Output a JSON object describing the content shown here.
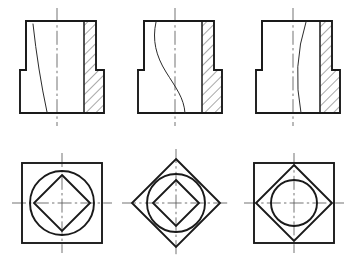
{
  "drawing": {
    "title": "Orthographic section views of intersecting solids",
    "sheet_width": 354,
    "sheet_height": 264,
    "background_color": "#ffffff",
    "line_color": "#1a1a1a",
    "curve_color": "#2b2b2b",
    "centerline_color": "#5a5a5a",
    "hatch_color": "#333333",
    "view_count": 6,
    "rows": 2,
    "columns": 3
  },
  "views": [
    {
      "id": "front-view-1",
      "label": "Front section view 1",
      "position": "top-left",
      "type": "front-section",
      "body_outline": "Stepped block: tall upper rectangle on a wider lower base",
      "upper_rect": {
        "x": 26,
        "y": 21,
        "width": 70,
        "height": 49
      },
      "lower_rect": {
        "x": 20,
        "y": 70,
        "width": 84,
        "height": 43
      },
      "hatch_region": "right vertical band stepped outward at base",
      "hatch_angle_deg": 45,
      "intersection_curve": "near-straight line sloping right-to-left downward",
      "vertical_centerline_x": 57,
      "centerline_top_y": 8,
      "centerline_bottom_y": 126
    },
    {
      "id": "front-view-2",
      "label": "Front section view 2",
      "position": "top-center",
      "type": "front-section",
      "body_outline": "Stepped block: tall upper rectangle on a wider lower base",
      "upper_rect": {
        "x": 144,
        "y": 21,
        "width": 70,
        "height": 49
      },
      "lower_rect": {
        "x": 138,
        "y": 70,
        "width": 84,
        "height": 43
      },
      "hatch_region": "right vertical band stepped outward at base",
      "hatch_angle_deg": 45,
      "intersection_curve": "S-shaped double-curve crossing the centerline",
      "vertical_centerline_x": 175,
      "centerline_top_y": 8,
      "centerline_bottom_y": 126
    },
    {
      "id": "front-view-3",
      "label": "Front section view 3",
      "position": "top-right",
      "type": "front-section",
      "body_outline": "Stepped block: tall upper rectangle on a wider lower base",
      "upper_rect": {
        "x": 262,
        "y": 21,
        "width": 70,
        "height": 49
      },
      "lower_rect": {
        "x": 256,
        "y": 70,
        "width": 84,
        "height": 43
      },
      "hatch_region": "right vertical band stepped outward at base",
      "hatch_angle_deg": 45,
      "intersection_curve": "steep slanted line from upper-right to lower-left",
      "vertical_centerline_x": 293,
      "centerline_top_y": 8,
      "centerline_bottom_y": 126
    },
    {
      "id": "plan-view-1",
      "label": "Plan view 1",
      "position": "bottom-left",
      "type": "plan",
      "outer_shape": "square",
      "middle_shape": "circle",
      "inner_shape": "diamond",
      "center": {
        "x": 62,
        "y": 203
      },
      "square_half_size": 40,
      "circle_radius": 32,
      "diamond_half_diagonal": 28,
      "centerline_extent": 50
    },
    {
      "id": "plan-view-2",
      "label": "Plan view 2",
      "position": "bottom-center",
      "type": "plan",
      "outer_shape": "diamond",
      "middle_shape": "circle",
      "inner_shape": "diamond",
      "center": {
        "x": 176,
        "y": 203
      },
      "outer_diamond_half_diagonal": 44,
      "circle_radius": 29,
      "inner_diamond_half_diagonal": 23,
      "centerline_extent": 54
    },
    {
      "id": "plan-view-3",
      "label": "Plan view 3",
      "position": "bottom-right",
      "type": "plan",
      "outer_shape": "square",
      "middle_shape": "diamond",
      "inner_shape": "circle",
      "center": {
        "x": 294,
        "y": 203
      },
      "square_half_size": 40,
      "diamond_half_diagonal": 38,
      "circle_radius": 23,
      "centerline_extent": 50
    }
  ]
}
